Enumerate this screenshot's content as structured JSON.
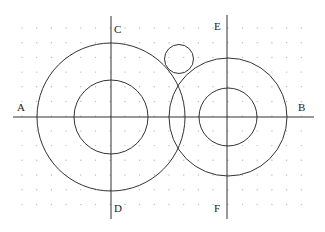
{
  "diagram": {
    "type": "geometric-construction",
    "background": "#ffffff",
    "line_color": "#333333",
    "grid": {
      "color": "#bbbbbb",
      "spacing": 14.7,
      "origin_x": 22,
      "origin_y": 28,
      "cols": 20,
      "rows": 13
    },
    "axes": [
      {
        "id": "AB",
        "x1": 13,
        "y1": 117,
        "x2": 314,
        "y2": 117
      },
      {
        "id": "CD",
        "x1": 111,
        "y1": 16,
        "x2": 111,
        "y2": 219
      },
      {
        "id": "EF",
        "x1": 227,
        "y1": 15,
        "x2": 227,
        "y2": 219
      }
    ],
    "circles": [
      {
        "id": "left-outer",
        "cx": 111,
        "cy": 117,
        "r": 74
      },
      {
        "id": "left-inner",
        "cx": 111,
        "cy": 117,
        "r": 37
      },
      {
        "id": "right-outer",
        "cx": 228,
        "cy": 117,
        "r": 59
      },
      {
        "id": "right-inner",
        "cx": 228,
        "cy": 117,
        "r": 29
      },
      {
        "id": "small-tangent",
        "cx": 179,
        "cy": 59,
        "r": 14.5
      }
    ],
    "labels": [
      {
        "text": "A",
        "x": 17,
        "y": 102
      },
      {
        "text": "B",
        "x": 298,
        "y": 102
      },
      {
        "text": "C",
        "x": 114,
        "y": 24
      },
      {
        "text": "D",
        "x": 114,
        "y": 203
      },
      {
        "text": "E",
        "x": 214,
        "y": 21
      },
      {
        "text": "F",
        "x": 214,
        "y": 203
      }
    ]
  }
}
